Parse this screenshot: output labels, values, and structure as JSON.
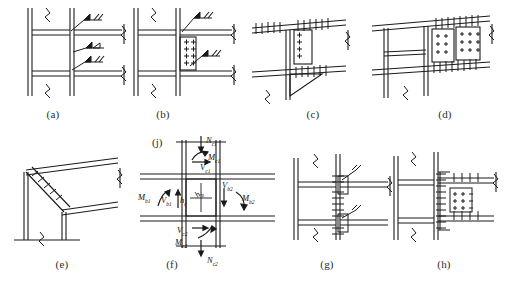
{
  "figure": {
    "background_color": "#ffffff",
    "line_color": "#1a1a1a",
    "panel_count": 9
  },
  "captions": [
    {
      "key": "a",
      "label": "(a)"
    },
    {
      "key": "b",
      "label": "(b)"
    },
    {
      "key": "c",
      "label": "(c)"
    },
    {
      "key": "d",
      "label": "(d)"
    },
    {
      "key": "e",
      "label": "(e)"
    },
    {
      "key": "f",
      "label": "(f)"
    },
    {
      "key": "g",
      "label": "(g)"
    },
    {
      "key": "h",
      "label": "(h)"
    },
    {
      "key": "j",
      "label": "(j)"
    }
  ],
  "panels": [
    {
      "key": "a",
      "name": "fully-welded-connection",
      "description": "Column with two beams fully welded, three weld symbol leaders"
    },
    {
      "key": "b",
      "name": "bolted-end-plate-connection",
      "description": "Column with bolted end plate, two bolt columns, weld symbols"
    },
    {
      "key": "c",
      "name": "bolted-plate-with-haunch-bracket",
      "description": "Bolted shear plate with triangular haunch bracket"
    },
    {
      "key": "d",
      "name": "double-bolt-group-splice",
      "description": "Two 3x3 bolt groups at beam splice"
    },
    {
      "key": "e",
      "name": "diagonal-haunch-brace",
      "description": "Diagonal bolted haunch brace between column and beam"
    },
    {
      "key": "f",
      "name": "panel-zone-free-body-diagram",
      "description": "Free body diagram of joint panel zone with forces"
    },
    {
      "key": "g",
      "name": "bolted-web-connection",
      "description": "Column with bolted web angles at two beam levels"
    },
    {
      "key": "h",
      "name": "bolted-flange-and-web-plate",
      "description": "Bolted flange plates plus web plate connection"
    }
  ],
  "force_labels": {
    "column_top": [
      {
        "id": "N_c1",
        "base": "N",
        "sub": "c1",
        "meaning": "axial force top column"
      },
      {
        "id": "M_c1",
        "base": "M",
        "sub": "c1",
        "meaning": "moment top column"
      },
      {
        "id": "V_c1",
        "base": "V",
        "sub": "c1",
        "meaning": "shear top column"
      }
    ],
    "column_bottom": [
      {
        "id": "V_c2",
        "base": "V",
        "sub": "c2",
        "meaning": "shear bottom column"
      },
      {
        "id": "M_c2",
        "base": "M",
        "sub": "c2",
        "meaning": "moment bottom column"
      },
      {
        "id": "N_c2",
        "base": "N",
        "sub": "c2",
        "meaning": "axial force bottom column"
      }
    ],
    "beam_left": [
      {
        "id": "M_b1",
        "base": "M",
        "sub": "b1",
        "meaning": "moment left beam"
      },
      {
        "id": "V_b1",
        "base": "V",
        "sub": "b1",
        "meaning": "shear left beam"
      }
    ],
    "beam_right": [
      {
        "id": "V_b2",
        "base": "V",
        "sub": "b2",
        "meaning": "shear right beam"
      },
      {
        "id": "M_b2",
        "base": "M",
        "sub": "b2",
        "meaning": "moment right beam"
      }
    ],
    "dimensions": [
      {
        "id": "h_c",
        "base": "h",
        "sub": "c",
        "meaning": "panel zone column depth"
      },
      {
        "id": "h_b",
        "base": "h",
        "sub": "b",
        "meaning": "panel zone beam depth"
      }
    ]
  }
}
